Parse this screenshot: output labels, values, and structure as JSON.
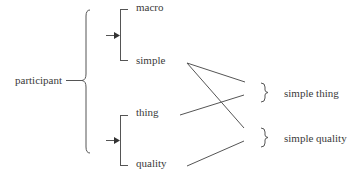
{
  "diagram": {
    "type": "system-network",
    "root": {
      "label": "participant"
    },
    "systems": [
      {
        "name": "upper-system",
        "options": [
          {
            "label": "macro"
          },
          {
            "label": "simple"
          }
        ]
      },
      {
        "name": "lower-system",
        "options": [
          {
            "label": "thing"
          },
          {
            "label": "quality"
          }
        ]
      }
    ],
    "combinations": [
      {
        "label": "simple thing"
      },
      {
        "label": "simple quality"
      }
    ],
    "connections": [
      {
        "from": "simple",
        "to": "simple thing"
      },
      {
        "from": "simple",
        "to": "simple quality"
      },
      {
        "from": "thing",
        "to": "simple thing"
      },
      {
        "from": "quality",
        "to": "simple quality"
      }
    ],
    "colors": {
      "line": "#555555",
      "text": "#3a3a3a",
      "background": "#ffffff"
    }
  }
}
